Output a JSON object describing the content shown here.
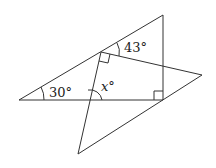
{
  "diagram": {
    "type": "geometry",
    "stroke_color": "#333333",
    "background": "#ffffff",
    "points": {
      "A": [
        19,
        100
      ],
      "B": [
        163,
        15
      ],
      "C": [
        163,
        100
      ],
      "P": [
        101,
        52
      ],
      "R": [
        202,
        75
      ],
      "D": [
        78,
        154
      ]
    },
    "segments": [
      [
        "A",
        "B"
      ],
      [
        "B",
        "C"
      ],
      [
        "A",
        "C"
      ],
      [
        "P",
        "R"
      ],
      [
        "R",
        "D"
      ],
      [
        "P",
        "D"
      ]
    ],
    "right_angles": [
      "C",
      "P"
    ],
    "labels": {
      "angle_a": "30°",
      "angle_top": "43°",
      "angle_x": "x°"
    }
  }
}
